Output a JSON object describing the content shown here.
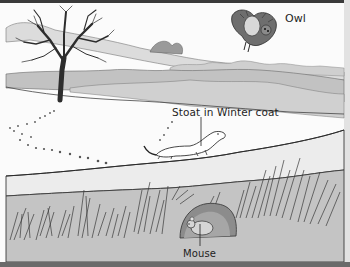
{
  "illustration": {
    "description": "Grayscale winter landscape: bare tree, snowy field with footprints, stoat in winter coat, owl flying overhead, mouse in burrow beneath snow",
    "labels": {
      "owl": "Owl",
      "stoat": "Stoat in Winter coat",
      "mouse": "Mouse"
    },
    "colors": {
      "snow": "#fbfbfb",
      "hedgerow": "#bdbdbd",
      "soil": "#c4c4c4",
      "ink": "#2a2a2a",
      "frame": "#3a3a3a"
    }
  }
}
